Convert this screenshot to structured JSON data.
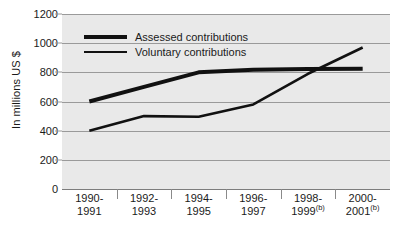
{
  "chart_data": {
    "type": "line",
    "title": "",
    "xlabel": "",
    "ylabel": "In millions US $",
    "ylim": [
      0,
      1200
    ],
    "yticks": [
      0,
      200,
      400,
      600,
      800,
      1000,
      1200
    ],
    "grid": true,
    "legend_position": "top-left inside plot",
    "categories": [
      "1990-\n1991",
      "1992-\n1993",
      "1994-\n1995",
      "1996-\n1997",
      "1998-\n1999(b)",
      "2000-\n2001(b)"
    ],
    "category_lines": [
      {
        "top": "1990-",
        "bottom": "1991",
        "note": ""
      },
      {
        "top": "1992-",
        "bottom": "1993",
        "note": ""
      },
      {
        "top": "1994-",
        "bottom": "1995",
        "note": ""
      },
      {
        "top": "1996-",
        "bottom": "1997",
        "note": ""
      },
      {
        "top": "1998-",
        "bottom": "1999",
        "note": "(b)"
      },
      {
        "top": "2000-",
        "bottom": "2001",
        "note": "(b)"
      }
    ],
    "series": [
      {
        "name": "Assessed contributions",
        "values": [
          600,
          700,
          800,
          818,
          822,
          825
        ],
        "color": "#111111",
        "stroke_width": 4
      },
      {
        "name": "Voluntary contributions",
        "values": [
          400,
          500,
          495,
          580,
          790,
          970
        ],
        "color": "#111111",
        "stroke_width": 2.6
      }
    ]
  },
  "axis": {
    "y_title": "In millions US $",
    "y_tick_labels": [
      "1200",
      "1000",
      "800",
      "600",
      "400",
      "200",
      "0"
    ]
  },
  "legend": {
    "items": [
      {
        "label": "Assessed contributions",
        "style": "thick"
      },
      {
        "label": "Voluntary contributions",
        "style": "thin"
      }
    ]
  },
  "colors": {
    "plot_background": "#e9e9e9",
    "page_background": "#ffffff",
    "gridline": "#9a9a9a",
    "line": "#111111",
    "text": "#1a1a1a"
  }
}
